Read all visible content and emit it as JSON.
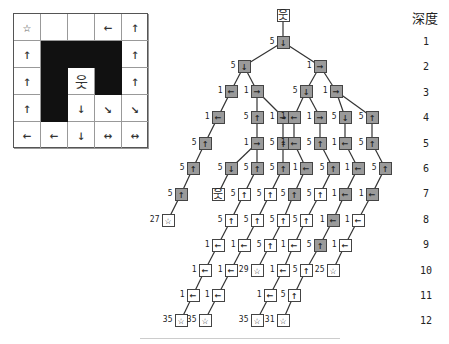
{
  "maze": {
    "rows": 5,
    "cols": 5,
    "cells": [
      [
        "☆",
        "",
        "",
        "←",
        "↑"
      ],
      [
        "↑",
        "#",
        "#",
        "#",
        "↑"
      ],
      [
        "↑",
        "#",
        "웃",
        "#",
        "↑"
      ],
      [
        "↑",
        "#",
        "↓",
        "↘",
        "↘"
      ],
      [
        "←",
        "←",
        "↓",
        "↔",
        "↔"
      ]
    ]
  },
  "depth_header": "深度",
  "depths": [
    "1",
    "2",
    "3",
    "4",
    "5",
    "6",
    "7",
    "8",
    "9",
    "10",
    "11",
    "12"
  ],
  "tree": {
    "nodes": [
      {
        "id": "root",
        "x": 283,
        "y": 15,
        "glyph": "웃",
        "cost": "",
        "fill": "white"
      },
      {
        "id": "d1a",
        "x": 283,
        "y": 42,
        "glyph": "↓",
        "cost": "5",
        "fill": "gray",
        "parent": "root"
      },
      {
        "id": "d2a",
        "x": 244,
        "y": 66,
        "glyph": "↓",
        "cost": "5",
        "fill": "gray",
        "parent": "d1a"
      },
      {
        "id": "d2b",
        "x": 320,
        "y": 66,
        "glyph": "→",
        "cost": "1",
        "fill": "gray",
        "parent": "d1a"
      },
      {
        "id": "d3a",
        "x": 231,
        "y": 91,
        "glyph": "←",
        "cost": "1",
        "fill": "gray",
        "parent": "d2a"
      },
      {
        "id": "d3b",
        "x": 257,
        "y": 91,
        "glyph": "→",
        "cost": "1",
        "fill": "gray",
        "parent": "d2a"
      },
      {
        "id": "d3c",
        "x": 306,
        "y": 91,
        "glyph": "↓",
        "cost": "5",
        "fill": "gray",
        "parent": "d2b"
      },
      {
        "id": "d3d",
        "x": 336,
        "y": 91,
        "glyph": "→",
        "cost": "1",
        "fill": "gray",
        "parent": "d2b"
      },
      {
        "id": "d4a",
        "x": 218,
        "y": 117,
        "glyph": "←",
        "cost": "1",
        "fill": "gray",
        "parent": "d3a"
      },
      {
        "id": "d4b",
        "x": 257,
        "y": 117,
        "glyph": "↑",
        "cost": "5",
        "fill": "gray",
        "parent": "d3b"
      },
      {
        "id": "d4c",
        "x": 283,
        "y": 117,
        "glyph": "→",
        "cost": "1",
        "fill": "gray",
        "parent": "d3b"
      },
      {
        "id": "d4d",
        "x": 294,
        "y": 117,
        "glyph": "←",
        "cost": "1",
        "fill": "gray",
        "parent": "d3c"
      },
      {
        "id": "d4e",
        "x": 320,
        "y": 117,
        "glyph": "→",
        "cost": "1",
        "fill": "gray",
        "parent": "d3c"
      },
      {
        "id": "d4f",
        "x": 345,
        "y": 117,
        "glyph": "↓",
        "cost": "5",
        "fill": "gray",
        "parent": "d3d"
      },
      {
        "id": "d4g",
        "x": 372,
        "y": 117,
        "glyph": "↑",
        "cost": "5",
        "fill": "gray",
        "parent": "d3d"
      },
      {
        "id": "d5a",
        "x": 205,
        "y": 143,
        "glyph": "↑",
        "cost": "5",
        "fill": "gray",
        "parent": "d4a"
      },
      {
        "id": "d5b",
        "x": 257,
        "y": 143,
        "glyph": "→",
        "cost": "1",
        "fill": "gray",
        "parent": "d4b"
      },
      {
        "id": "d5c",
        "x": 283,
        "y": 143,
        "glyph": "↑",
        "cost": "5",
        "fill": "gray",
        "parent": "d4c"
      },
      {
        "id": "d5d",
        "x": 294,
        "y": 143,
        "glyph": "←",
        "cost": "1",
        "fill": "gray",
        "parent": "d4d"
      },
      {
        "id": "d5e",
        "x": 320,
        "y": 143,
        "glyph": "↑",
        "cost": "5",
        "fill": "gray",
        "parent": "d4e"
      },
      {
        "id": "d5f",
        "x": 345,
        "y": 143,
        "glyph": "←",
        "cost": "1",
        "fill": "gray",
        "parent": "d4f"
      },
      {
        "id": "d5g",
        "x": 372,
        "y": 143,
        "glyph": "↑",
        "cost": "5",
        "fill": "gray",
        "parent": "d4g"
      },
      {
        "id": "d6a",
        "x": 193,
        "y": 168,
        "glyph": "↑",
        "cost": "5",
        "fill": "gray",
        "parent": "d5a"
      },
      {
        "id": "d6b",
        "x": 231,
        "y": 168,
        "glyph": "↓",
        "cost": "5",
        "fill": "gray",
        "parent": "d5b"
      },
      {
        "id": "d6c",
        "x": 257,
        "y": 168,
        "glyph": "↑",
        "cost": "5",
        "fill": "gray",
        "parent": "d5b"
      },
      {
        "id": "d6d",
        "x": 283,
        "y": 168,
        "glyph": "↑",
        "cost": "5",
        "fill": "gray",
        "parent": "d5c"
      },
      {
        "id": "d6e",
        "x": 306,
        "y": 168,
        "glyph": "←",
        "cost": "1",
        "fill": "gray",
        "parent": "d5d"
      },
      {
        "id": "d6f",
        "x": 333,
        "y": 168,
        "glyph": "↑",
        "cost": "5",
        "fill": "gray",
        "parent": "d5e"
      },
      {
        "id": "d6g",
        "x": 358,
        "y": 168,
        "glyph": "←",
        "cost": "1",
        "fill": "gray",
        "parent": "d5f"
      },
      {
        "id": "d6h",
        "x": 385,
        "y": 168,
        "glyph": "↑",
        "cost": "5",
        "fill": "gray",
        "parent": "d5g"
      },
      {
        "id": "d7a",
        "x": 181,
        "y": 194,
        "glyph": "↑",
        "cost": "5",
        "fill": "gray",
        "parent": "d6a"
      },
      {
        "id": "d7b",
        "x": 218,
        "y": 194,
        "glyph": "웃",
        "cost": "",
        "fill": "white",
        "parent": "d6b"
      },
      {
        "id": "d7c",
        "x": 244,
        "y": 194,
        "glyph": "↑",
        "cost": "5",
        "fill": "white",
        "parent": "d6c"
      },
      {
        "id": "d7d",
        "x": 270,
        "y": 194,
        "glyph": "↑",
        "cost": "5",
        "fill": "white",
        "parent": "d6d"
      },
      {
        "id": "d7e",
        "x": 294,
        "y": 194,
        "glyph": "↑",
        "cost": "5",
        "fill": "gray",
        "parent": "d6e"
      },
      {
        "id": "d7f",
        "x": 320,
        "y": 194,
        "glyph": "↑",
        "cost": "5",
        "fill": "white",
        "parent": "d6f"
      },
      {
        "id": "d7g",
        "x": 345,
        "y": 194,
        "glyph": "←",
        "cost": "1",
        "fill": "gray",
        "parent": "d6g"
      },
      {
        "id": "d7h",
        "x": 372,
        "y": 194,
        "glyph": "←",
        "cost": "1",
        "fill": "gray",
        "parent": "d6h"
      },
      {
        "id": "d8a",
        "x": 168,
        "y": 220,
        "glyph": "☆",
        "cost": "27",
        "fill": "white",
        "parent": "d7a"
      },
      {
        "id": "d8b",
        "x": 231,
        "y": 220,
        "glyph": "↑",
        "cost": "5",
        "fill": "white",
        "parent": "d7c"
      },
      {
        "id": "d8c",
        "x": 257,
        "y": 220,
        "glyph": "↑",
        "cost": "5",
        "fill": "white",
        "parent": "d7d"
      },
      {
        "id": "d8d",
        "x": 283,
        "y": 220,
        "glyph": "↑",
        "cost": "5",
        "fill": "white",
        "parent": "d7e"
      },
      {
        "id": "d8e",
        "x": 306,
        "y": 220,
        "glyph": "↑",
        "cost": "5",
        "fill": "white",
        "parent": "d7f"
      },
      {
        "id": "d8f",
        "x": 333,
        "y": 220,
        "glyph": "←",
        "cost": "1",
        "fill": "gray",
        "parent": "d7g"
      },
      {
        "id": "d8g",
        "x": 358,
        "y": 220,
        "glyph": "←",
        "cost": "1",
        "fill": "white",
        "parent": "d7h"
      },
      {
        "id": "d9a",
        "x": 218,
        "y": 245,
        "glyph": "←",
        "cost": "1",
        "fill": "white",
        "parent": "d8b"
      },
      {
        "id": "d9b",
        "x": 244,
        "y": 245,
        "glyph": "←",
        "cost": "1",
        "fill": "white",
        "parent": "d8c"
      },
      {
        "id": "d9c",
        "x": 270,
        "y": 245,
        "glyph": "↑",
        "cost": "5",
        "fill": "white",
        "parent": "d8d"
      },
      {
        "id": "d9d",
        "x": 294,
        "y": 245,
        "glyph": "←",
        "cost": "1",
        "fill": "white",
        "parent": "d8e"
      },
      {
        "id": "d9e",
        "x": 320,
        "y": 245,
        "glyph": "↑",
        "cost": "5",
        "fill": "gray",
        "parent": "d8f"
      },
      {
        "id": "d9f",
        "x": 345,
        "y": 245,
        "glyph": "←",
        "cost": "1",
        "fill": "white",
        "parent": "d8g"
      },
      {
        "id": "d10a",
        "x": 205,
        "y": 270,
        "glyph": "←",
        "cost": "1",
        "fill": "white",
        "parent": "d9a"
      },
      {
        "id": "d10b",
        "x": 231,
        "y": 270,
        "glyph": "←",
        "cost": "1",
        "fill": "white",
        "parent": "d9b"
      },
      {
        "id": "d10c",
        "x": 257,
        "y": 270,
        "glyph": "☆",
        "cost": "29",
        "fill": "white",
        "parent": "d9c"
      },
      {
        "id": "d10d",
        "x": 283,
        "y": 270,
        "glyph": "←",
        "cost": "1",
        "fill": "white",
        "parent": "d9d"
      },
      {
        "id": "d10e",
        "x": 306,
        "y": 270,
        "glyph": "↑",
        "cost": "5",
        "fill": "white",
        "parent": "d9e"
      },
      {
        "id": "d10f",
        "x": 333,
        "y": 270,
        "glyph": "☆",
        "cost": "25",
        "fill": "white",
        "parent": "d9f"
      },
      {
        "id": "d11a",
        "x": 193,
        "y": 295,
        "glyph": "←",
        "cost": "1",
        "fill": "white",
        "parent": "d10a"
      },
      {
        "id": "d11b",
        "x": 218,
        "y": 295,
        "glyph": "←",
        "cost": "1",
        "fill": "white",
        "parent": "d10b"
      },
      {
        "id": "d11c",
        "x": 270,
        "y": 295,
        "glyph": "←",
        "cost": "1",
        "fill": "white",
        "parent": "d10d"
      },
      {
        "id": "d11d",
        "x": 294,
        "y": 295,
        "glyph": "↑",
        "cost": "5",
        "fill": "white",
        "parent": "d10e"
      },
      {
        "id": "d12a",
        "x": 181,
        "y": 320,
        "glyph": "☆",
        "cost": "35",
        "fill": "white",
        "parent": "d11a"
      },
      {
        "id": "d12b",
        "x": 205,
        "y": 320,
        "glyph": "☆",
        "cost": "35",
        "fill": "white",
        "parent": "d11b"
      },
      {
        "id": "d12c",
        "x": 257,
        "y": 320,
        "glyph": "☆",
        "cost": "35",
        "fill": "white",
        "parent": "d11c"
      },
      {
        "id": "d12d",
        "x": 283,
        "y": 320,
        "glyph": "☆",
        "cost": "31",
        "fill": "white",
        "parent": "d11d"
      }
    ]
  },
  "colors": {
    "expanded_node": "#9a9a9a",
    "frontier_node": "#ffffff",
    "wall": "#111111",
    "edge": "#333333"
  }
}
